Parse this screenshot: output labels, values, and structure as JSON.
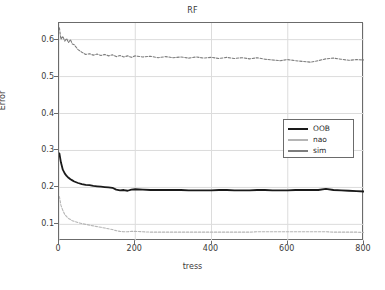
{
  "chart_data": {
    "type": "line",
    "title": "RF",
    "xlabel": "tress",
    "ylabel": "Error",
    "xlim": [
      0,
      800
    ],
    "ylim": [
      0.055,
      0.645
    ],
    "grid": true,
    "legend_position": "center-right",
    "xticks": [
      "0",
      "200",
      "400",
      "600",
      "800"
    ],
    "xtick_values": [
      0,
      200,
      400,
      600,
      800
    ],
    "yticks": [
      "0.1",
      "0.2",
      "0.3",
      "0.4",
      "0.5",
      "0.6"
    ],
    "ytick_values": [
      0.1,
      0.2,
      0.3,
      0.4,
      0.5,
      0.6
    ],
    "x": [
      1,
      5,
      10,
      15,
      20,
      25,
      30,
      35,
      40,
      50,
      60,
      70,
      80,
      90,
      100,
      110,
      120,
      130,
      140,
      150,
      160,
      170,
      180,
      190,
      200,
      220,
      240,
      260,
      280,
      300,
      320,
      340,
      360,
      380,
      400,
      420,
      440,
      460,
      480,
      500,
      520,
      540,
      560,
      580,
      600,
      620,
      640,
      660,
      680,
      700,
      720,
      740,
      760,
      780,
      800
    ],
    "series": [
      {
        "name": "OOB",
        "color": "#1a1a1a",
        "style": "solid",
        "width": 1.8,
        "values": [
          0.292,
          0.268,
          0.248,
          0.238,
          0.231,
          0.226,
          0.222,
          0.219,
          0.216,
          0.212,
          0.209,
          0.207,
          0.206,
          0.204,
          0.203,
          0.202,
          0.201,
          0.2,
          0.199,
          0.194,
          0.192,
          0.193,
          0.191,
          0.194,
          0.195,
          0.194,
          0.193,
          0.193,
          0.193,
          0.193,
          0.193,
          0.192,
          0.192,
          0.192,
          0.192,
          0.193,
          0.193,
          0.192,
          0.192,
          0.192,
          0.193,
          0.193,
          0.192,
          0.192,
          0.192,
          0.193,
          0.193,
          0.193,
          0.193,
          0.196,
          0.193,
          0.192,
          0.191,
          0.19,
          0.189
        ]
      },
      {
        "name": "nao",
        "color": "#b5b5b5",
        "style": "dashed",
        "width": 1.1,
        "values": [
          0.175,
          0.152,
          0.138,
          0.127,
          0.121,
          0.116,
          0.113,
          0.11,
          0.108,
          0.105,
          0.102,
          0.1,
          0.098,
          0.096,
          0.094,
          0.092,
          0.09,
          0.088,
          0.086,
          0.083,
          0.081,
          0.08,
          0.08,
          0.081,
          0.081,
          0.08,
          0.079,
          0.079,
          0.079,
          0.079,
          0.079,
          0.079,
          0.079,
          0.079,
          0.079,
          0.079,
          0.079,
          0.079,
          0.079,
          0.079,
          0.08,
          0.08,
          0.08,
          0.08,
          0.08,
          0.08,
          0.08,
          0.08,
          0.08,
          0.08,
          0.079,
          0.079,
          0.079,
          0.079,
          0.078
        ]
      },
      {
        "name": "sim",
        "color": "#7d7d7d",
        "style": "dashed",
        "width": 1.1,
        "values": [
          0.632,
          0.601,
          0.609,
          0.596,
          0.603,
          0.592,
          0.6,
          0.588,
          0.586,
          0.573,
          0.566,
          0.56,
          0.562,
          0.558,
          0.561,
          0.557,
          0.56,
          0.556,
          0.559,
          0.554,
          0.557,
          0.553,
          0.556,
          0.552,
          0.556,
          0.553,
          0.555,
          0.551,
          0.554,
          0.551,
          0.553,
          0.55,
          0.553,
          0.55,
          0.552,
          0.549,
          0.552,
          0.549,
          0.551,
          0.548,
          0.551,
          0.547,
          0.545,
          0.543,
          0.546,
          0.543,
          0.541,
          0.539,
          0.543,
          0.548,
          0.55,
          0.547,
          0.544,
          0.546,
          0.545
        ]
      }
    ],
    "legend": [
      {
        "label": "OOB",
        "color": "#1a1a1a",
        "width": 2.6
      },
      {
        "label": "nao",
        "color": "#b5b5b5",
        "width": 2.0
      },
      {
        "label": "sim",
        "color": "#7d7d7d",
        "width": 2.3
      }
    ],
    "colors": {
      "axis": "#6b6b6b",
      "grid": "#dcdcdc",
      "text": "#3a3a3a",
      "background": "#ffffff"
    }
  }
}
